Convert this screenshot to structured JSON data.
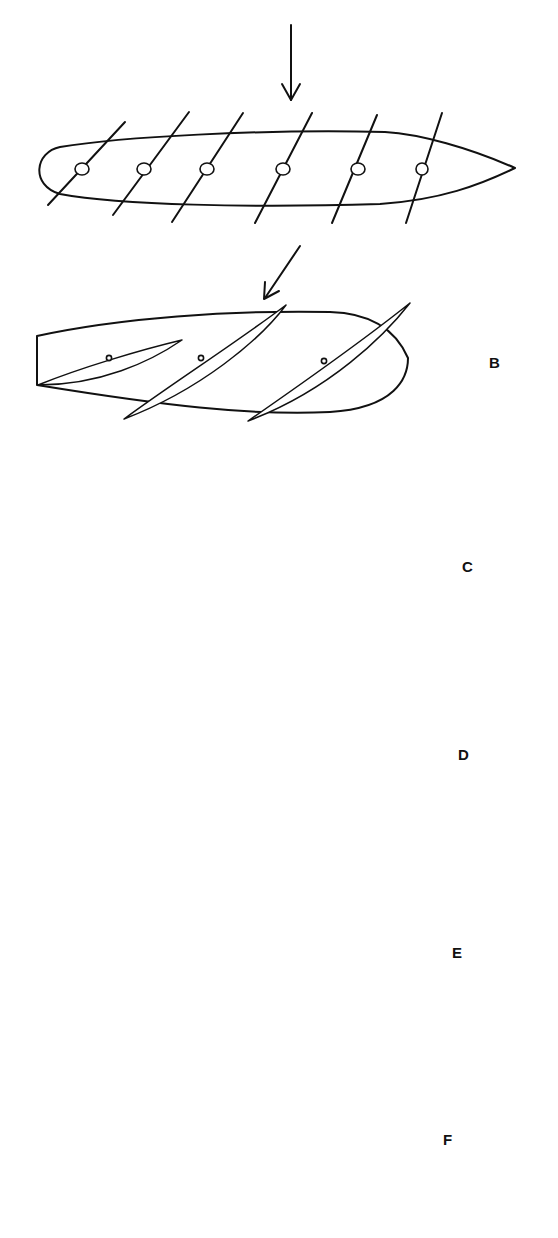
{
  "figure": {
    "panels": [
      {
        "id": "A",
        "label": "",
        "arrow": "vertical down",
        "blades": 6,
        "blade_style": "straight lines with circular pivots"
      },
      {
        "id": "B",
        "label": "B",
        "arrow": "diagonal down-left",
        "blades": 3
      },
      {
        "id": "C",
        "label": "C",
        "arrow": "diagonal down-right",
        "blades": 3
      },
      {
        "id": "D",
        "label": "D",
        "arrow": "diagonal down-right",
        "blades": 3
      },
      {
        "id": "E",
        "label": "E",
        "arrow": "diagonal down-right",
        "blades": 3
      },
      {
        "id": "F",
        "label": "F",
        "arrow": "vertical down",
        "blades": 3
      }
    ]
  },
  "colors": {
    "ink": "#111111",
    "background": "#ffffff"
  }
}
